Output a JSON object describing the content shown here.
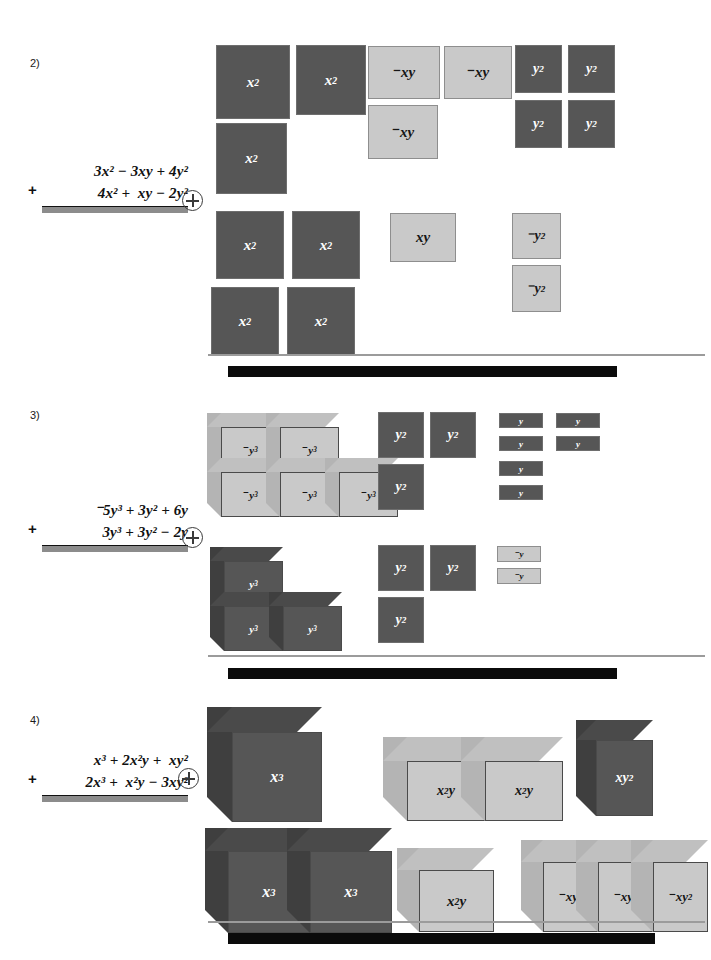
{
  "page": {
    "width": 711,
    "height": 960,
    "background": "#ffffff"
  },
  "colors": {
    "tile_dark": "#565656",
    "tile_light": "#c9c9c9",
    "expression_bar": "#8c8c8c",
    "separator_thin": "#9b9b9b",
    "separator_thick": "#0b0b0b",
    "text": "#111111"
  },
  "problems": [
    {
      "number": "2)",
      "operator_symbol": "+",
      "expression": {
        "plus_sign": "+",
        "top_line": "3x² − 3xy + 4y²",
        "bottom_line": "4x² +  xy − 2y²",
        "answer_bar": ""
      },
      "row1": {
        "groups": [
          {
            "label": "x²",
            "sign": "positive",
            "count": 3,
            "shape": "square"
          },
          {
            "label": "⁻xy",
            "sign": "negative",
            "count": 3,
            "shape": "rect"
          },
          {
            "label": "y²",
            "sign": "positive",
            "count": 4,
            "shape": "square"
          }
        ]
      },
      "row2": {
        "groups": [
          {
            "label": "x²",
            "sign": "positive",
            "count": 4,
            "shape": "square"
          },
          {
            "label": "xy",
            "sign": "positive",
            "count": 1,
            "shape": "rect"
          },
          {
            "label": "⁻y²",
            "sign": "negative",
            "count": 2,
            "shape": "square"
          }
        ]
      }
    },
    {
      "number": "3)",
      "operator_symbol": "+",
      "expression": {
        "plus_sign": "+",
        "top_line": "⁻5y³ + 3y² + 6y",
        "bottom_line": "3y³ + 3y² − 2y",
        "answer_bar": ""
      },
      "row1": {
        "groups": [
          {
            "label": "⁻y³",
            "sign": "negative",
            "count": 5,
            "shape": "cube"
          },
          {
            "label": "y²",
            "sign": "positive",
            "count": 3,
            "shape": "square"
          },
          {
            "label": "y",
            "sign": "positive",
            "count": 6,
            "shape": "bar"
          }
        ]
      },
      "row2": {
        "groups": [
          {
            "label": "y³",
            "sign": "positive",
            "count": 3,
            "shape": "cube"
          },
          {
            "label": "y²",
            "sign": "positive",
            "count": 3,
            "shape": "square"
          },
          {
            "label": "⁻y",
            "sign": "negative",
            "count": 2,
            "shape": "bar"
          }
        ]
      }
    },
    {
      "number": "4)",
      "operator_symbol": "+",
      "expression": {
        "plus_sign": "+",
        "top_line": " x³ + 2x²y +  xy²",
        "bottom_line": "2x³ +  x²y − 3xy²",
        "answer_bar": ""
      },
      "row1": {
        "groups": [
          {
            "label": "x³",
            "sign": "positive",
            "count": 1,
            "shape": "cube"
          },
          {
            "label": "x²y",
            "sign": "positive",
            "count": 2,
            "shape": "slab"
          },
          {
            "label": "xy²",
            "sign": "positive",
            "count": 1,
            "shape": "prism"
          }
        ]
      },
      "row2": {
        "groups": [
          {
            "label": "x³",
            "sign": "positive",
            "count": 2,
            "shape": "cube"
          },
          {
            "label": "x²y",
            "sign": "positive",
            "count": 1,
            "shape": "slab"
          },
          {
            "label": "⁻xy²",
            "sign": "negative",
            "count": 3,
            "shape": "prism"
          }
        ]
      }
    }
  ],
  "tiles": {
    "p2r1": [
      {
        "t": "x",
        "e": "2",
        "neg": false,
        "x": 216,
        "y": 45,
        "w": 74,
        "h": 74,
        "dark": true
      },
      {
        "t": "x",
        "e": "2",
        "neg": false,
        "x": 296,
        "y": 45,
        "w": 70,
        "h": 70,
        "dark": true
      },
      {
        "t": "x",
        "e": "2",
        "neg": false,
        "x": 216,
        "y": 123,
        "w": 71,
        "h": 71,
        "dark": true
      },
      {
        "t": "xy",
        "e": "",
        "neg": true,
        "x": 368,
        "y": 46,
        "w": 72,
        "h": 53,
        "dark": false
      },
      {
        "t": "xy",
        "e": "",
        "neg": true,
        "x": 444,
        "y": 46,
        "w": 68,
        "h": 53,
        "dark": false
      },
      {
        "t": "xy",
        "e": "",
        "neg": true,
        "x": 368,
        "y": 105,
        "w": 70,
        "h": 54,
        "dark": false
      },
      {
        "t": "y",
        "e": "2",
        "neg": false,
        "x": 515,
        "y": 45,
        "w": 47,
        "h": 48,
        "dark": true
      },
      {
        "t": "y",
        "e": "2",
        "neg": false,
        "x": 568,
        "y": 45,
        "w": 47,
        "h": 48,
        "dark": true
      },
      {
        "t": "y",
        "e": "2",
        "neg": false,
        "x": 515,
        "y": 100,
        "w": 47,
        "h": 48,
        "dark": true
      },
      {
        "t": "y",
        "e": "2",
        "neg": false,
        "x": 568,
        "y": 100,
        "w": 47,
        "h": 48,
        "dark": true
      }
    ],
    "p2r2": [
      {
        "t": "x",
        "e": "2",
        "neg": false,
        "x": 216,
        "y": 211,
        "w": 68,
        "h": 68,
        "dark": true
      },
      {
        "t": "x",
        "e": "2",
        "neg": false,
        "x": 292,
        "y": 211,
        "w": 68,
        "h": 68,
        "dark": true
      },
      {
        "t": "x",
        "e": "2",
        "neg": false,
        "x": 211,
        "y": 287,
        "w": 68,
        "h": 68,
        "dark": true
      },
      {
        "t": "x",
        "e": "2",
        "neg": false,
        "x": 287,
        "y": 287,
        "w": 68,
        "h": 68,
        "dark": true
      },
      {
        "t": "xy",
        "e": "",
        "neg": false,
        "x": 390,
        "y": 213,
        "w": 66,
        "h": 49,
        "dark": false
      },
      {
        "t": "y",
        "e": "2",
        "neg": true,
        "x": 512,
        "y": 213,
        "w": 49,
        "h": 46,
        "dark": false
      },
      {
        "t": "y",
        "e": "2",
        "neg": true,
        "x": 512,
        "y": 265,
        "w": 49,
        "h": 47,
        "dark": false
      }
    ],
    "p3r1": [
      {
        "t": "y",
        "e": "2",
        "neg": false,
        "x": 378,
        "y": 412,
        "w": 46,
        "h": 46,
        "dark": true
      },
      {
        "t": "y",
        "e": "2",
        "neg": false,
        "x": 430,
        "y": 412,
        "w": 46,
        "h": 46,
        "dark": true
      },
      {
        "t": "y",
        "e": "2",
        "neg": false,
        "x": 378,
        "y": 464,
        "w": 46,
        "h": 46,
        "dark": true
      },
      {
        "t": "y",
        "e": "",
        "neg": false,
        "x": 499,
        "y": 413,
        "w": 44,
        "h": 15,
        "dark": true
      },
      {
        "t": "y",
        "e": "",
        "neg": false,
        "x": 556,
        "y": 413,
        "w": 44,
        "h": 15,
        "dark": true
      },
      {
        "t": "y",
        "e": "",
        "neg": false,
        "x": 499,
        "y": 436,
        "w": 44,
        "h": 15,
        "dark": true
      },
      {
        "t": "y",
        "e": "",
        "neg": false,
        "x": 556,
        "y": 436,
        "w": 44,
        "h": 15,
        "dark": true
      },
      {
        "t": "y",
        "e": "",
        "neg": false,
        "x": 499,
        "y": 461,
        "w": 44,
        "h": 15,
        "dark": true
      },
      {
        "t": "y",
        "e": "",
        "neg": false,
        "x": 499,
        "y": 485,
        "w": 44,
        "h": 15,
        "dark": true
      }
    ],
    "p3r2": [
      {
        "t": "y",
        "e": "2",
        "neg": false,
        "x": 378,
        "y": 545,
        "w": 46,
        "h": 46,
        "dark": true
      },
      {
        "t": "y",
        "e": "2",
        "neg": false,
        "x": 430,
        "y": 545,
        "w": 46,
        "h": 46,
        "dark": true
      },
      {
        "t": "y",
        "e": "2",
        "neg": false,
        "x": 378,
        "y": 597,
        "w": 46,
        "h": 46,
        "dark": true
      },
      {
        "t": "y",
        "e": "",
        "neg": true,
        "x": 497,
        "y": 546,
        "w": 44,
        "h": 16,
        "dark": false
      },
      {
        "t": "y",
        "e": "",
        "neg": true,
        "x": 497,
        "y": 568,
        "w": 44,
        "h": 16,
        "dark": false
      }
    ]
  },
  "blocks": {
    "p3r1": [
      {
        "t": "y",
        "e": "3",
        "neg": true,
        "x": 207,
        "y": 413,
        "w": 59,
        "h": 45,
        "d": 14,
        "dark": false
      },
      {
        "t": "y",
        "e": "3",
        "neg": true,
        "x": 266,
        "y": 413,
        "w": 59,
        "h": 45,
        "d": 14,
        "dark": false
      },
      {
        "t": "y",
        "e": "3",
        "neg": true,
        "x": 207,
        "y": 458,
        "w": 59,
        "h": 45,
        "d": 14,
        "dark": false
      },
      {
        "t": "y",
        "e": "3",
        "neg": true,
        "x": 266,
        "y": 458,
        "w": 59,
        "h": 45,
        "d": 14,
        "dark": false
      },
      {
        "t": "y",
        "e": "3",
        "neg": true,
        "x": 325,
        "y": 458,
        "w": 59,
        "h": 45,
        "d": 14,
        "dark": false
      }
    ],
    "p3r2": [
      {
        "t": "y",
        "e": "3",
        "neg": false,
        "x": 210,
        "y": 547,
        "w": 59,
        "h": 45,
        "d": 14,
        "dark": true
      },
      {
        "t": "y",
        "e": "3",
        "neg": false,
        "x": 210,
        "y": 592,
        "w": 59,
        "h": 45,
        "d": 14,
        "dark": true
      },
      {
        "t": "y",
        "e": "3",
        "neg": false,
        "x": 269,
        "y": 592,
        "w": 59,
        "h": 45,
        "d": 14,
        "dark": true
      }
    ],
    "p4r1": [
      {
        "t": "x",
        "e": "3",
        "neg": false,
        "x": 207,
        "y": 707,
        "w": 90,
        "h": 90,
        "d": 25,
        "dark": true
      },
      {
        "t": "x2y",
        "e": "",
        "neg": false,
        "x": 383,
        "y": 737,
        "w": 78,
        "h": 60,
        "d": 24,
        "dark": false
      },
      {
        "t": "x2y",
        "e": "",
        "neg": false,
        "x": 461,
        "y": 737,
        "w": 78,
        "h": 60,
        "d": 24,
        "dark": false
      },
      {
        "t": "xy",
        "e": "2",
        "neg": false,
        "x": 576,
        "y": 720,
        "w": 57,
        "h": 76,
        "d": 20,
        "dark": true
      }
    ],
    "p4r2": [
      {
        "t": "x",
        "e": "3",
        "neg": false,
        "x": 205,
        "y": 828,
        "w": 82,
        "h": 82,
        "d": 23,
        "dark": true
      },
      {
        "t": "x",
        "e": "3",
        "neg": false,
        "x": 287,
        "y": 828,
        "w": 82,
        "h": 82,
        "d": 23,
        "dark": true
      },
      {
        "t": "x2y",
        "e": "",
        "neg": false,
        "x": 397,
        "y": 848,
        "w": 75,
        "h": 62,
        "d": 22,
        "dark": false
      },
      {
        "t": "xy",
        "e": "2",
        "neg": true,
        "x": 521,
        "y": 840,
        "w": 55,
        "h": 70,
        "d": 22,
        "dark": false
      },
      {
        "t": "xy",
        "e": "2",
        "neg": true,
        "x": 576,
        "y": 840,
        "w": 55,
        "h": 70,
        "d": 22,
        "dark": false
      },
      {
        "t": "xy",
        "e": "2",
        "neg": true,
        "x": 631,
        "y": 840,
        "w": 55,
        "h": 70,
        "d": 22,
        "dark": false
      }
    ]
  },
  "separators": [
    {
      "thin": {
        "x": 208,
        "y": 354,
        "w": 497
      },
      "thick": {
        "x": 228,
        "y": 366,
        "w": 389
      }
    },
    {
      "thin": {
        "x": 208,
        "y": 655,
        "w": 497
      },
      "thick": {
        "x": 228,
        "y": 668,
        "w": 389
      }
    },
    {
      "thin": {
        "x": 208,
        "y": 921,
        "w": 497
      },
      "thick": {
        "x": 228,
        "y": 933,
        "w": 427
      }
    }
  ]
}
